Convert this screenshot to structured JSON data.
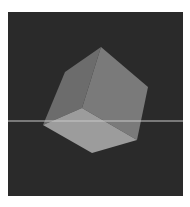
{
  "scene": {
    "description": "3D rendered cube on dark background",
    "background_color": "#2a2a2a",
    "frame_color": "#ffffff",
    "horizon_line_color": "#c8c8c8",
    "faces": [
      {
        "name": "left-face",
        "color": "#6c6c6c",
        "points": "101,47 65,72 43,125 82,108"
      },
      {
        "name": "right-face",
        "color": "#7a7a7a",
        "points": "101,47 148,87 137,140 82,108"
      },
      {
        "name": "bottom-face",
        "color": "#9c9c9c",
        "points": "82,108 137,140 92,153 43,125"
      }
    ]
  }
}
